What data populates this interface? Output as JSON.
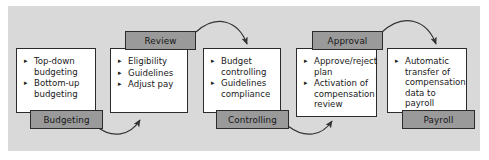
{
  "diagram": {
    "panel_color": "#d9d9d9",
    "tag_color": "#9a9a9a",
    "card_color": "#ffffff",
    "line_color": "#333333",
    "bullet_glyph": "▸",
    "stages": [
      {
        "id": "budgeting",
        "tag": "Budgeting",
        "tag_position": "bottom",
        "items": [
          "Top-down budgeting",
          "Bottom-up budgeting"
        ]
      },
      {
        "id": "review",
        "tag": "Review",
        "tag_position": "top",
        "items": [
          "Eligibility",
          "Guidelines",
          "Adjust pay"
        ]
      },
      {
        "id": "controlling",
        "tag": "Controlling",
        "tag_position": "bottom",
        "items": [
          "Budget controlling",
          "Guidelines compliance"
        ]
      },
      {
        "id": "approval",
        "tag": "Approval",
        "tag_position": "top",
        "items": [
          "Approve/reject plan",
          "Activation of compensation review"
        ]
      },
      {
        "id": "payroll",
        "tag": "Payroll",
        "tag_position": "bottom",
        "items": [
          "Automatic transfer of compensation data to payroll"
        ]
      }
    ]
  }
}
